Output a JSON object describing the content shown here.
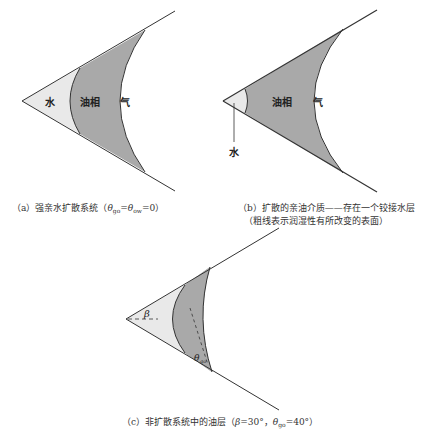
{
  "colors": {
    "water_fill": "#e9e9e9",
    "oil_fill": "#a9a9a9",
    "line": "#333333",
    "background": "#ffffff"
  },
  "panel_a": {
    "labels": {
      "water": "水",
      "oil": "油相",
      "gas": "气"
    },
    "caption": {
      "prefix": "（a）强亲水扩散系统（",
      "theta": "θ",
      "sub1": "go",
      "eq": "=",
      "sub2": "ow",
      "suffix": "=0）"
    }
  },
  "panel_b": {
    "labels": {
      "water": "水",
      "oil": "油相",
      "gas": "气"
    },
    "caption_line1": "（b）扩散的亲油介质——存在一个铰接水层",
    "caption_line2": "（粗线表示润湿性有所改变的表面）"
  },
  "panel_c": {
    "labels": {
      "beta": "β",
      "theta": "θ",
      "theta_sub": "go"
    },
    "caption": {
      "prefix": "（c）非扩散系统中的油层（",
      "beta": "β",
      "beta_val": "=30°，",
      "theta": "θ",
      "theta_sub": "go",
      "theta_val": "=40°）"
    }
  }
}
